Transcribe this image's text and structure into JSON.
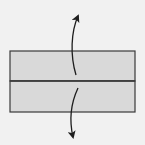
{
  "diagram": {
    "type": "origami-fold-step",
    "colors": {
      "background": "#f1f1f1",
      "paper_fill": "#d9d9d9",
      "outline": "#3a3a3a",
      "arrow": "#1e1e1e"
    },
    "shapes": {
      "top_half": {
        "x": 10,
        "y": 51,
        "width": 125,
        "height": 30
      },
      "bottom_half": {
        "x": 10,
        "y": 81,
        "width": 125,
        "height": 31
      },
      "crease_y": 81
    },
    "arrows": [
      {
        "name": "arrow-up",
        "direction": "up",
        "from": [
          76,
          75
        ],
        "to": [
          79,
          13
        ]
      },
      {
        "name": "arrow-down",
        "direction": "down",
        "from": [
          78,
          88
        ],
        "to": [
          73,
          141
        ]
      }
    ]
  }
}
